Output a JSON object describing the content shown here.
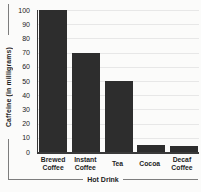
{
  "chart_data": {
    "type": "bar",
    "title": "",
    "categories": [
      "Brewed Coffee",
      "Instant Coffee",
      "Tea",
      "Cocoa",
      "Decaf Coffee"
    ],
    "values": [
      100,
      70,
      50,
      5,
      4
    ],
    "xlabel": "Hot Drink",
    "ylabel": "Caffeine (in milligrams)",
    "ylim": [
      0,
      100
    ],
    "yticks": [
      0,
      10,
      20,
      30,
      40,
      50,
      60,
      70,
      80,
      90,
      100
    ],
    "grid": true,
    "legend": "none",
    "bar_color": "#2d2d2d",
    "gridline_color": "#e7e7e7",
    "axis_color": "#3a3a3a",
    "text_color": "#1d1d1d",
    "decoration_line_color": "#7d7d7d",
    "background_color": "#fbfbfa"
  }
}
